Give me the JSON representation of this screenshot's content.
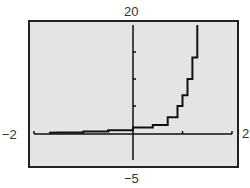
{
  "chart_data": {
    "type": "line",
    "title": "",
    "xlabel": "",
    "ylabel": "",
    "xlim": [
      -2,
      2
    ],
    "ylim": [
      -5,
      20
    ],
    "window_labels": {
      "xmin": "−2",
      "xmax": "2",
      "ymin": "−5",
      "ymax": "20"
    },
    "y_ticks": [
      5,
      10,
      15
    ],
    "x_ticks": [
      -2,
      1,
      2
    ],
    "grid": false,
    "series": [
      {
        "name": "curve",
        "x": [
          -1.5,
          -1.0,
          -0.5,
          0.0,
          0.4,
          0.7,
          0.9,
          1.0,
          1.1,
          1.2,
          1.3
        ],
        "y": [
          0.1,
          0.3,
          0.5,
          1.0,
          1.5,
          2.9,
          5.0,
          7.0,
          10.0,
          14.0,
          20.0
        ]
      }
    ]
  },
  "colors": {
    "background": "#e4e4e4",
    "frame": "#222222",
    "curve": "#111111",
    "labels": "#333333"
  }
}
